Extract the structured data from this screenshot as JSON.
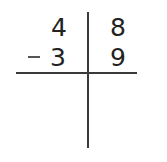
{
  "problem": {
    "type": "vertical-subtraction-place-value",
    "columns": [
      "tens",
      "ones"
    ],
    "minuend": {
      "tens": "4",
      "ones": "8"
    },
    "subtrahend": {
      "tens": "3",
      "ones": "9"
    },
    "operator": "−",
    "answer": {
      "tens": "",
      "ones": ""
    }
  },
  "colors": {
    "ink": "#222222",
    "lines": "#3a3a3a",
    "background": "#ffffff"
  }
}
